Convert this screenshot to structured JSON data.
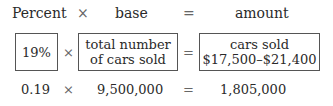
{
  "header": {
    "percent": "Percent",
    "times": "×",
    "base": "base",
    "equals": "=",
    "amount": "amount"
  },
  "boxes": {
    "percent": "19%",
    "times": "×",
    "base_line1": "total number",
    "base_line2": "of cars sold",
    "equals": "=",
    "amount_line1": "cars sold",
    "amount_line2": "$17,500–$21,400"
  },
  "calculation": {
    "percent": "0.19",
    "times": "×",
    "base": "9,500,000",
    "equals": "=",
    "amount": "1,805,000"
  }
}
